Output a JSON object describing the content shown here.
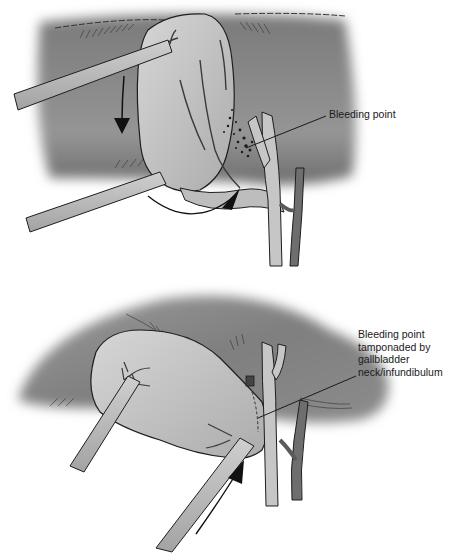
{
  "figure": {
    "panels": [
      {
        "id": "top",
        "description": "Gallbladder fundus retracted cephalad; bleeding from cystic artery region",
        "label": "Bleeding point"
      },
      {
        "id": "bottom",
        "description": "Gallbladder neck pushed onto bleeding point to tamponade",
        "label": "Bleeding point\ntamponaded by\ngallbladder\nneck/infundibulum"
      }
    ],
    "colors": {
      "liver_shadow": "#8a8a8a",
      "gallbladder": "#c4c4c4",
      "instrument": "#b5b5b5",
      "duct": "#bdbdbd",
      "artery": "#6e6e6e",
      "outline": "#1e1e1e"
    }
  }
}
